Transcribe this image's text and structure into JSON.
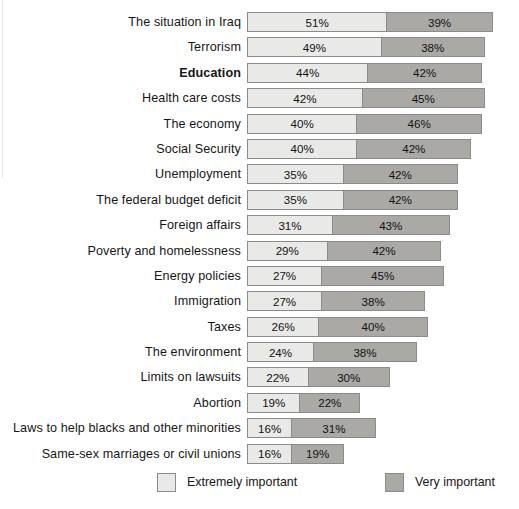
{
  "chart_data": {
    "type": "bar",
    "subtype": "stacked-horizontal",
    "title": "",
    "subtitle": "",
    "xlabel": "",
    "ylabel": "",
    "xlim": [
      0,
      100
    ],
    "x_unit": "%",
    "grid": false,
    "legend_position": "bottom",
    "categories": [
      "The situation in Iraq",
      "Terrorism",
      "Education",
      "Health care costs",
      "The economy",
      "Social Security",
      "Unemployment",
      "The federal budget deficit",
      "Foreign affairs",
      "Poverty and homelessness",
      "Energy policies",
      "Immigration",
      "Taxes",
      "The environment",
      "Limits on lawsuits",
      "Abortion",
      "Laws to help blacks and other minorities",
      "Same-sex marriages or civil unions"
    ],
    "series": [
      {
        "name": "Extremely important",
        "color": "#e9e9e7",
        "values": [
          51,
          49,
          44,
          42,
          40,
          40,
          35,
          35,
          31,
          29,
          27,
          27,
          26,
          24,
          22,
          19,
          16,
          16
        ],
        "labels": [
          "51%",
          "49%",
          "44%",
          "42%",
          "40%",
          "40%",
          "35%",
          "35%",
          "31%",
          "29%",
          "27%",
          "27%",
          "26%",
          "24%",
          "22%",
          "19%",
          "16%",
          "16%"
        ]
      },
      {
        "name": "Very important",
        "color": "#aaa9a6",
        "values": [
          39,
          38,
          42,
          45,
          46,
          42,
          42,
          42,
          43,
          42,
          45,
          38,
          40,
          38,
          30,
          22,
          31,
          19
        ],
        "labels": [
          "39%",
          "38%",
          "42%",
          "45%",
          "46%",
          "42%",
          "42%",
          "42%",
          "43%",
          "42%",
          "45%",
          "38%",
          "40%",
          "38%",
          "30%",
          "22%",
          "31%",
          "19%"
        ]
      }
    ],
    "emphasized_categories": [
      "Education"
    ]
  },
  "rows": [
    {
      "label": "The situation in Iraq",
      "bold": false,
      "extremely": 51,
      "very": 39,
      "extremely_label": "51%",
      "very_label": "39%"
    },
    {
      "label": "Terrorism",
      "bold": false,
      "extremely": 49,
      "very": 38,
      "extremely_label": "49%",
      "very_label": "38%"
    },
    {
      "label": "Education",
      "bold": true,
      "extremely": 44,
      "very": 42,
      "extremely_label": "44%",
      "very_label": "42%"
    },
    {
      "label": "Health care costs",
      "bold": false,
      "extremely": 42,
      "very": 45,
      "extremely_label": "42%",
      "very_label": "45%"
    },
    {
      "label": "The economy",
      "bold": false,
      "extremely": 40,
      "very": 46,
      "extremely_label": "40%",
      "very_label": "46%"
    },
    {
      "label": "Social Security",
      "bold": false,
      "extremely": 40,
      "very": 42,
      "extremely_label": "40%",
      "very_label": "42%"
    },
    {
      "label": "Unemployment",
      "bold": false,
      "extremely": 35,
      "very": 42,
      "extremely_label": "35%",
      "very_label": "42%"
    },
    {
      "label": "The federal budget deficit",
      "bold": false,
      "extremely": 35,
      "very": 42,
      "extremely_label": "35%",
      "very_label": "42%"
    },
    {
      "label": "Foreign affairs",
      "bold": false,
      "extremely": 31,
      "very": 43,
      "extremely_label": "31%",
      "very_label": "43%"
    },
    {
      "label": "Poverty and homelessness",
      "bold": false,
      "extremely": 29,
      "very": 42,
      "extremely_label": "29%",
      "very_label": "42%"
    },
    {
      "label": "Energy policies",
      "bold": false,
      "extremely": 27,
      "very": 45,
      "extremely_label": "27%",
      "very_label": "45%"
    },
    {
      "label": "Immigration",
      "bold": false,
      "extremely": 27,
      "very": 38,
      "extremely_label": "27%",
      "very_label": "38%"
    },
    {
      "label": "Taxes",
      "bold": false,
      "extremely": 26,
      "very": 40,
      "extremely_label": "26%",
      "very_label": "40%"
    },
    {
      "label": "The environment",
      "bold": false,
      "extremely": 24,
      "very": 38,
      "extremely_label": "24%",
      "very_label": "38%"
    },
    {
      "label": "Limits on lawsuits",
      "bold": false,
      "extremely": 22,
      "very": 30,
      "extremely_label": "22%",
      "very_label": "30%"
    },
    {
      "label": "Abortion",
      "bold": false,
      "extremely": 19,
      "very": 22,
      "extremely_label": "19%",
      "very_label": "22%"
    },
    {
      "label": "Laws to help blacks and other minorities",
      "bold": false,
      "extremely": 16,
      "very": 31,
      "extremely_label": "16%",
      "very_label": "31%"
    },
    {
      "label": "Same-sex marriages or civil unions",
      "bold": false,
      "extremely": 16,
      "very": 19,
      "extremely_label": "16%",
      "very_label": "19%"
    }
  ],
  "legend": {
    "extremely": {
      "label": "Extremely important",
      "color": "#e9e9e7"
    },
    "very": {
      "label": "Very important",
      "color": "#aaa9a6"
    }
  },
  "scale": {
    "px_per_percent": 2.71,
    "bar_origin_x": 247
  }
}
